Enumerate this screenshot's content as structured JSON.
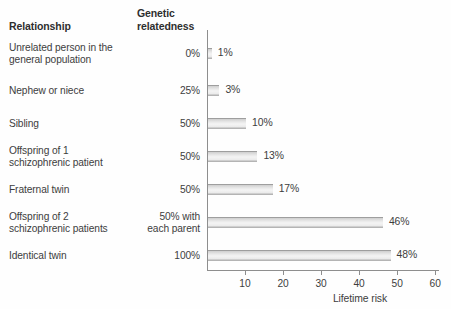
{
  "headers": {
    "relationship": "Relationship",
    "relatedness": "Genetic\nrelatedness"
  },
  "rows": [
    {
      "label": "Unrelated person in the\ngeneral population",
      "relatedness": "0%",
      "risk": 1,
      "risk_label": "1%",
      "label_top": 42,
      "value_top": 48,
      "bar_top": 48
    },
    {
      "label": "Nephew or niece",
      "relatedness": "25%",
      "risk": 3,
      "risk_label": "3%",
      "label_top": 85,
      "value_top": 85,
      "bar_top": 85
    },
    {
      "label": "Sibling",
      "relatedness": "50%",
      "risk": 10,
      "risk_label": "10%",
      "label_top": 118,
      "value_top": 118,
      "bar_top": 118
    },
    {
      "label": "Offspring of 1\nschizophrenic patient",
      "relatedness": "50%",
      "risk": 13,
      "risk_label": "13%",
      "label_top": 145,
      "value_top": 151,
      "bar_top": 151
    },
    {
      "label": "Fraternal twin",
      "relatedness": "50%",
      "risk": 17,
      "risk_label": "17%",
      "label_top": 184,
      "value_top": 184,
      "bar_top": 184
    },
    {
      "label": "Offspring of 2\nschizophrenic patients",
      "relatedness": "50% with\neach parent",
      "risk": 46,
      "risk_label": "46%",
      "label_top": 211,
      "value_top": 211,
      "bar_top": 217
    },
    {
      "label": "Identical twin",
      "relatedness": "100%",
      "risk": 48,
      "risk_label": "48%",
      "label_top": 250,
      "value_top": 250,
      "bar_top": 250
    }
  ],
  "axis": {
    "title": "Lifetime risk",
    "ticks": [
      10,
      20,
      30,
      40,
      50,
      60
    ],
    "tick_labels": [
      "10",
      "20",
      "30",
      "40",
      "50",
      "60"
    ],
    "min": 0,
    "max": 61
  },
  "colors": {
    "text": "#3d3d3d",
    "axis": "#8e8e8e",
    "bar_light": "#f4f4f4",
    "bar_edge": "#9e9e9e",
    "background": "#fefefe"
  },
  "chart_data": {
    "type": "bar",
    "orientation": "horizontal",
    "title": "",
    "xlabel": "Lifetime risk",
    "ylabel": "",
    "xlim": [
      0,
      61
    ],
    "grid": false,
    "legend": "none",
    "categories": [
      "Unrelated person in the general population",
      "Nephew or niece",
      "Sibling",
      "Offspring of 1 schizophrenic patient",
      "Fraternal twin",
      "Offspring of 2 schizophrenic patients",
      "Identical twin"
    ],
    "values": [
      1,
      3,
      10,
      13,
      17,
      46,
      48
    ],
    "data_labels": [
      "1%",
      "3%",
      "10%",
      "13%",
      "17%",
      "46%",
      "48%"
    ],
    "genetic_relatedness": [
      "0%",
      "25%",
      "50%",
      "50%",
      "50%",
      "50% with each parent",
      "100%"
    ],
    "xticks": [
      10,
      20,
      30,
      40,
      50,
      60
    ]
  }
}
